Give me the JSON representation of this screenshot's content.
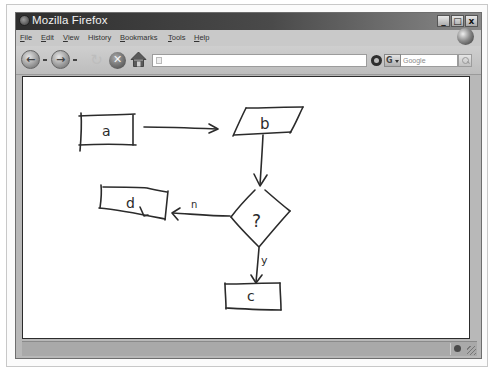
{
  "window": {
    "title": "Mozilla Firefox",
    "controls": {
      "minimize": "_",
      "maximize": "□",
      "close": "x"
    }
  },
  "menubar": {
    "items": [
      {
        "label": "File",
        "accel": "F",
        "rest": "ile"
      },
      {
        "label": "Edit",
        "accel": "E",
        "rest": "dit"
      },
      {
        "label": "View",
        "accel": "V",
        "rest": "iew"
      },
      {
        "label": "History",
        "accel": "",
        "rest": "History"
      },
      {
        "label": "Bookmarks",
        "accel": "B",
        "rest": "ookmarks"
      },
      {
        "label": "Tools",
        "accel": "T",
        "rest": "ools"
      },
      {
        "label": "Help",
        "accel": "H",
        "rest": "elp"
      }
    ]
  },
  "navbar": {
    "back_icon": "back-arrow-icon",
    "forward_icon": "forward-arrow-icon",
    "reload_icon": "reload-icon",
    "stop_icon": "stop-x-icon",
    "home_icon": "home-icon",
    "url_value": "",
    "search_placeholder": "Google",
    "search_engine_glyph": "G"
  },
  "content": {
    "diagram": {
      "type": "hand-drawn flowchart",
      "nodes": [
        {
          "id": "a",
          "shape": "rectangle",
          "label": "a"
        },
        {
          "id": "b",
          "shape": "parallelogram",
          "label": "b"
        },
        {
          "id": "decision",
          "shape": "diamond",
          "label": "?"
        },
        {
          "id": "d",
          "shape": "rectangle",
          "label": "d"
        },
        {
          "id": "c",
          "shape": "rectangle",
          "label": "c"
        }
      ],
      "edges": [
        {
          "from": "a",
          "to": "b",
          "label": ""
        },
        {
          "from": "b",
          "to": "decision",
          "label": ""
        },
        {
          "from": "decision",
          "to": "d",
          "label": "n"
        },
        {
          "from": "decision",
          "to": "c",
          "label": "y"
        }
      ]
    }
  },
  "statusbar": {
    "text": ""
  }
}
